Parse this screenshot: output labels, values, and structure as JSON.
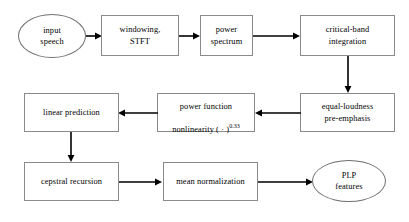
{
  "diagram": {
    "type": "flowchart",
    "orientation": "serpentine-horizontal",
    "colors": {
      "box_border": "#8a8a8a",
      "ellipse_border": "#6f6f6f",
      "arrow": "#000000",
      "text": "#000000",
      "background": "#ffffff"
    },
    "nodes": [
      {
        "id": "input-speech",
        "shape": "ellipse",
        "label": "input\nspeech",
        "row": 1
      },
      {
        "id": "windowing-stft",
        "shape": "box",
        "label": "windowing,\nSTFT",
        "row": 1
      },
      {
        "id": "power-spectrum",
        "shape": "box",
        "label": "power\nspectrum",
        "row": 1
      },
      {
        "id": "critical-band",
        "shape": "box",
        "label": "critical-band\nintegration",
        "row": 1
      },
      {
        "id": "equal-loudness",
        "shape": "box",
        "label": "equal-loudness\npre-emphasis",
        "row": 2
      },
      {
        "id": "power-nonlinearity",
        "shape": "box",
        "label_line1": "power function",
        "label_line2_pre": "nonlinearity ( ",
        "label_line2_dot": "·",
        "label_line2_mid": " )",
        "label_line2_sup": "0.33",
        "row": 2
      },
      {
        "id": "linear-prediction",
        "shape": "box",
        "label": "linear prediction",
        "row": 2
      },
      {
        "id": "cepstral-recursion",
        "shape": "box",
        "label": "cepstral recursion",
        "row": 3
      },
      {
        "id": "mean-normalization",
        "shape": "box",
        "label": "mean normalization",
        "row": 3
      },
      {
        "id": "plp-features",
        "shape": "ellipse",
        "label": "PLP\nfeatures",
        "row": 3
      }
    ],
    "edges": [
      {
        "from": "input-speech",
        "to": "windowing-stft",
        "direction": "right"
      },
      {
        "from": "windowing-stft",
        "to": "power-spectrum",
        "direction": "right"
      },
      {
        "from": "power-spectrum",
        "to": "critical-band",
        "direction": "right"
      },
      {
        "from": "critical-band",
        "to": "equal-loudness",
        "direction": "down"
      },
      {
        "from": "equal-loudness",
        "to": "power-nonlinearity",
        "direction": "left"
      },
      {
        "from": "power-nonlinearity",
        "to": "linear-prediction",
        "direction": "left"
      },
      {
        "from": "linear-prediction",
        "to": "cepstral-recursion",
        "direction": "down"
      },
      {
        "from": "cepstral-recursion",
        "to": "mean-normalization",
        "direction": "right"
      },
      {
        "from": "mean-normalization",
        "to": "plp-features",
        "direction": "right"
      }
    ]
  }
}
